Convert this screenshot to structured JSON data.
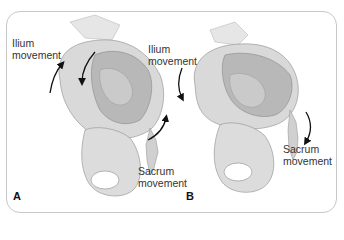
{
  "figure": {
    "panels": [
      {
        "id": "A",
        "letter": "A",
        "ilium_label_line1": "Ilium",
        "ilium_label_line2": "movement",
        "sacrum_label_line1": "Sacrum",
        "sacrum_label_line2": "movement",
        "ilium_arrow_direction": "up-then-down (anterior rotation)",
        "sacrum_arrow_direction": "up (counternutation)"
      },
      {
        "id": "B",
        "letter": "B",
        "ilium_label_line1": "Ilium",
        "ilium_label_line2": "movement",
        "sacrum_label_line1": "Sacrum",
        "sacrum_label_line2": "movement",
        "ilium_arrow_direction": "down (posterior rotation)",
        "sacrum_arrow_direction": "down (nutation)"
      }
    ],
    "colors": {
      "border": "#c8c8c8",
      "bone_fill": "#d9d9d9",
      "bone_shadow": "#a8a8a8",
      "arrow": "#111111",
      "text": "#333333"
    }
  }
}
